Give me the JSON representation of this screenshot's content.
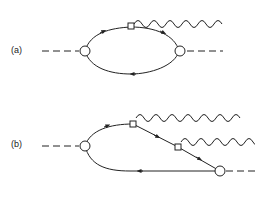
{
  "diagrams": [
    {
      "label": "(a)",
      "description": "one-loop self-energy with single photon emission vertex"
    },
    {
      "label": "(b)",
      "description": "triangle loop with two photon emission vertices"
    }
  ],
  "colors": {
    "line": "#222222",
    "background": "#ffffff"
  }
}
